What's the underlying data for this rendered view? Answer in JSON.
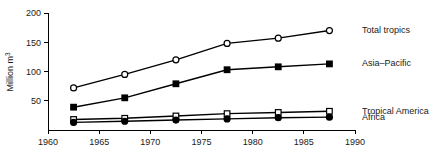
{
  "chart_data": {
    "type": "line",
    "title": "",
    "subtitle": "",
    "xlabel": "",
    "ylabel": "Million m³",
    "ylabel_parts": {
      "base": "Million m",
      "sup": "3"
    },
    "xlim": [
      1960,
      1990
    ],
    "ylim": [
      0,
      200
    ],
    "grid": false,
    "legend_position": "right-inline",
    "x_ticks": [
      1960,
      1965,
      1970,
      1975,
      1980,
      1985,
      1990
    ],
    "x_tick_labels": [
      "1960",
      "1965",
      "1970",
      "1975",
      "1980",
      "1985",
      "1990"
    ],
    "y_ticks": [
      50,
      100,
      150,
      200
    ],
    "y_tick_labels": [
      "50",
      "100",
      "150",
      "200"
    ],
    "x": [
      1962.5,
      1967.5,
      1972.5,
      1977.5,
      1982.5,
      1987.5
    ],
    "series": [
      {
        "name": "Total tropics",
        "marker": "open-circle",
        "color": "#000000",
        "values": [
          72,
          95,
          120,
          148,
          157,
          170
        ]
      },
      {
        "name": "Asia–Pacific",
        "marker": "filled-square",
        "color": "#000000",
        "values": [
          39,
          55,
          79,
          103,
          108,
          113
        ]
      },
      {
        "name": "Tropical America",
        "marker": "open-square",
        "color": "#000000",
        "values": [
          18,
          20,
          24,
          28,
          30,
          32
        ]
      },
      {
        "name": "Africa",
        "marker": "filled-circle",
        "color": "#000000",
        "values": [
          13,
          15,
          17,
          19,
          21,
          22
        ]
      }
    ]
  },
  "legend": {
    "items": [
      {
        "label": "Total tropics"
      },
      {
        "label": "Asia–Pacific"
      },
      {
        "label": "Tropical America"
      },
      {
        "label": "Africa"
      }
    ]
  }
}
